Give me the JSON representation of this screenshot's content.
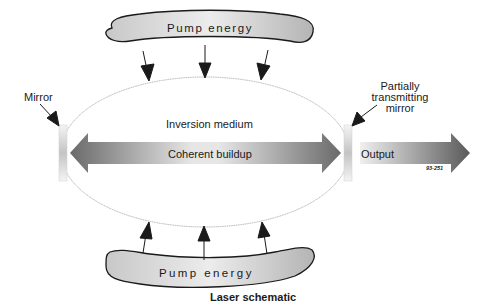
{
  "diagram": {
    "title": "Laser schematic",
    "figure_number": "93-251",
    "top_pump": {
      "label": "Pump energy"
    },
    "bottom_pump": {
      "label": "Pump energy"
    },
    "medium_label": "Inversion medium",
    "buildup_label": "Coherent buildup",
    "output_label": "Output",
    "left_mirror_label": "Mirror",
    "right_mirror_label_lines": [
      "Partially",
      "transmitting",
      "mirror"
    ],
    "colors": {
      "outline": "#1a1a1a",
      "gradient_dark": "#555555",
      "gradient_light": "#e8e8e8",
      "ellipse": "#9a9a9a"
    }
  }
}
